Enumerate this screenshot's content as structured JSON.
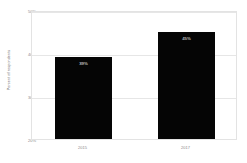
{
  "chart_data": {
    "type": "bar",
    "title": "",
    "subtitle": "",
    "xlabel": "",
    "ylabel": "Percent of respondents",
    "categories": [
      "2015",
      "2017"
    ],
    "values": [
      39,
      45
    ],
    "value_labels": [
      "39%",
      "45%"
    ],
    "ylim": [
      20,
      50
    ],
    "yticks": [
      20,
      30,
      40,
      50
    ],
    "ytick_labels": [
      "20%",
      "30%",
      "40%",
      "50%"
    ],
    "grid": true,
    "legend": null,
    "legend_position": "none",
    "colors": {
      "bar": "#050505",
      "grid": "#e6e6e6",
      "frame": "#e3e3e3",
      "tick_text": "#8a8a8a",
      "axis_title": "#6b6b6b",
      "value_text": "#ffffff",
      "background": "#ffffff"
    }
  }
}
